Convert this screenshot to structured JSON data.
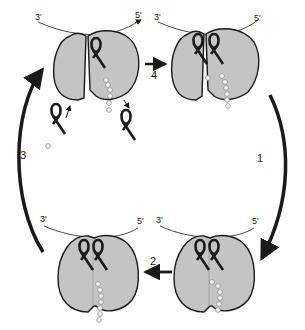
{
  "diagram": {
    "type": "cyclic process",
    "colors": {
      "ribosome_fill": "#c4c4c4",
      "outline": "#1a1a1a",
      "background": "#ffffff",
      "bead_fill": "#f2f2f2"
    },
    "mrna_labels": {
      "left_end": "3'",
      "right_end": "5'"
    },
    "panels": [
      {
        "id": "top-left",
        "state": "ribosome with one tRNA bound, two free tRNAs entering/leaving",
        "mrna_3": "3'",
        "mrna_5": "5'"
      },
      {
        "id": "top-right",
        "state": "ribosome with two tRNAs bound",
        "mrna_3": "3'",
        "mrna_5": "5'"
      },
      {
        "id": "bottom-right",
        "state": "closed ribosome with two tRNAs bound",
        "mrna_3": "3'",
        "mrna_5": "5'"
      },
      {
        "id": "bottom-left",
        "state": "closed ribosome with two tRNAs, peptide transferred",
        "mrna_3": "3'",
        "mrna_5": "5'"
      }
    ],
    "steps": [
      {
        "number": "1",
        "from": "top-right",
        "to": "bottom-right"
      },
      {
        "number": "2",
        "from": "bottom-right",
        "to": "bottom-left"
      },
      {
        "number": "3",
        "from": "bottom-left",
        "to": "top-left"
      },
      {
        "number": "4",
        "from": "top-left",
        "to": "top-right"
      }
    ]
  }
}
